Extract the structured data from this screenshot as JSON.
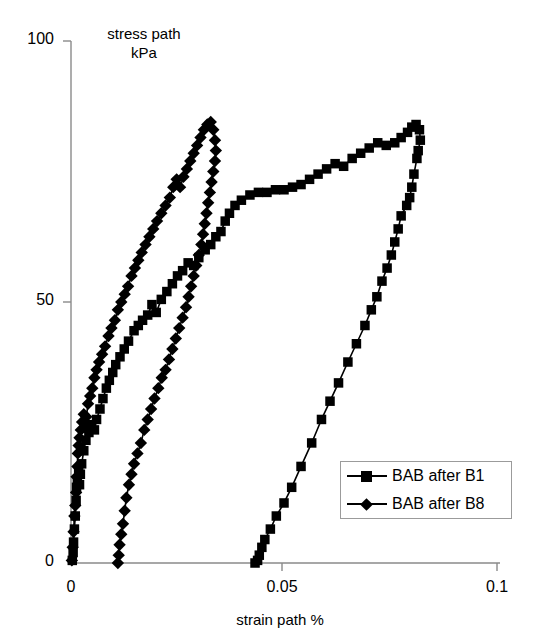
{
  "chart_data": {
    "type": "line",
    "title": "",
    "xlabel": "strain path %",
    "ylabel": "stress path\nkPa",
    "ylabel_line1": "stress path",
    "ylabel_line2": "kPa",
    "xlim": [
      0,
      0.1
    ],
    "ylim": [
      0,
      100
    ],
    "xticks": [
      "0",
      "0.05",
      "0.1"
    ],
    "xtick_values": [
      0,
      0.05,
      0.1
    ],
    "yticks": [
      "0",
      "50",
      "100"
    ],
    "ytick_values": [
      0,
      50,
      100
    ],
    "grid": false,
    "legend_position": "lower-right",
    "series": [
      {
        "name": "BAB after B1",
        "marker": "square",
        "color": "#000000",
        "points": [
          [
            0.0003,
            0.5
          ],
          [
            0.0005,
            2.0
          ],
          [
            0.0006,
            4.0
          ],
          [
            0.0008,
            6.5
          ],
          [
            0.001,
            9.0
          ],
          [
            0.0012,
            12.0
          ],
          [
            0.0013,
            14.5
          ],
          [
            0.0015,
            16.0
          ],
          [
            0.0018,
            17.5
          ],
          [
            0.002,
            15.0
          ],
          [
            0.0022,
            17.0
          ],
          [
            0.0025,
            19.0
          ],
          [
            0.003,
            21.5
          ],
          [
            0.0035,
            23.5
          ],
          [
            0.0042,
            25.0
          ],
          [
            0.0048,
            26.5
          ],
          [
            0.0055,
            25.5
          ],
          [
            0.006,
            27.5
          ],
          [
            0.0068,
            29.5
          ],
          [
            0.0075,
            31.5
          ],
          [
            0.0083,
            33.5
          ],
          [
            0.009,
            35.0
          ],
          [
            0.0098,
            36.5
          ],
          [
            0.0105,
            38.0
          ],
          [
            0.0115,
            39.5
          ],
          [
            0.0125,
            41.0
          ],
          [
            0.0135,
            42.5
          ],
          [
            0.0148,
            44.5
          ],
          [
            0.0158,
            45.5
          ],
          [
            0.0168,
            46.5
          ],
          [
            0.018,
            47.5
          ],
          [
            0.019,
            49.5
          ],
          [
            0.02,
            48.0
          ],
          [
            0.0212,
            50.5
          ],
          [
            0.0225,
            52.0
          ],
          [
            0.0238,
            53.5
          ],
          [
            0.025,
            55.0
          ],
          [
            0.0262,
            56.0
          ],
          [
            0.0275,
            57.5
          ],
          [
            0.0288,
            57.0
          ],
          [
            0.03,
            58.5
          ],
          [
            0.0315,
            60.0
          ],
          [
            0.0328,
            61.0
          ],
          [
            0.034,
            62.5
          ],
          [
            0.0352,
            63.5
          ],
          [
            0.0362,
            65.5
          ],
          [
            0.0372,
            67.0
          ],
          [
            0.0385,
            68.5
          ],
          [
            0.04,
            69.5
          ],
          [
            0.042,
            70.5
          ],
          [
            0.044,
            71.0
          ],
          [
            0.046,
            71.0
          ],
          [
            0.048,
            71.5
          ],
          [
            0.05,
            71.5
          ],
          [
            0.052,
            72.0
          ],
          [
            0.054,
            72.5
          ],
          [
            0.056,
            73.5
          ],
          [
            0.058,
            74.5
          ],
          [
            0.06,
            75.5
          ],
          [
            0.062,
            76.5
          ],
          [
            0.064,
            76.0
          ],
          [
            0.066,
            77.5
          ],
          [
            0.068,
            78.5
          ],
          [
            0.07,
            79.5
          ],
          [
            0.072,
            80.5
          ],
          [
            0.074,
            80.0
          ],
          [
            0.076,
            80.5
          ],
          [
            0.0775,
            81.5
          ],
          [
            0.079,
            82.5
          ],
          [
            0.08,
            83.5
          ],
          [
            0.081,
            84.0
          ],
          [
            0.0818,
            83.0
          ],
          [
            0.082,
            81.0
          ],
          [
            0.0815,
            79.0
          ],
          [
            0.0812,
            77.5
          ],
          [
            0.0805,
            74.5
          ],
          [
            0.08,
            72.0
          ],
          [
            0.0795,
            70.0
          ],
          [
            0.0788,
            68.5
          ],
          [
            0.0775,
            66.5
          ],
          [
            0.0768,
            64.0
          ],
          [
            0.076,
            61.5
          ],
          [
            0.0752,
            59.0
          ],
          [
            0.0742,
            56.5
          ],
          [
            0.073,
            54.0
          ],
          [
            0.0718,
            51.0
          ],
          [
            0.0705,
            48.5
          ],
          [
            0.069,
            45.5
          ],
          [
            0.067,
            42.0
          ],
          [
            0.065,
            38.5
          ],
          [
            0.0628,
            34.5
          ],
          [
            0.0608,
            31.0
          ],
          [
            0.0588,
            27.5
          ],
          [
            0.0565,
            23.0
          ],
          [
            0.054,
            18.5
          ],
          [
            0.0518,
            14.5
          ],
          [
            0.05,
            11.5
          ],
          [
            0.0482,
            9.0
          ],
          [
            0.0468,
            6.5
          ],
          [
            0.0455,
            4.5
          ],
          [
            0.0448,
            3.0
          ],
          [
            0.0442,
            1.5
          ],
          [
            0.0438,
            0.5
          ],
          [
            0.0432,
            0.0
          ]
        ]
      },
      {
        "name": "BAB after B8",
        "marker": "diamond",
        "color": "#000000",
        "points": [
          [
            0.0002,
            0.5
          ],
          [
            0.0004,
            3.0
          ],
          [
            0.0006,
            6.0
          ],
          [
            0.0008,
            9.0
          ],
          [
            0.001,
            11.0
          ],
          [
            0.0012,
            13.5
          ],
          [
            0.0013,
            16.5
          ],
          [
            0.0015,
            18.5
          ],
          [
            0.0016,
            21.0
          ],
          [
            0.0018,
            22.5
          ],
          [
            0.002,
            24.0
          ],
          [
            0.0023,
            25.5
          ],
          [
            0.0026,
            27.0
          ],
          [
            0.003,
            28.5
          ],
          [
            0.0033,
            26.0
          ],
          [
            0.0036,
            28.0
          ],
          [
            0.004,
            30.5
          ],
          [
            0.0045,
            32.0
          ],
          [
            0.005,
            33.5
          ],
          [
            0.0055,
            35.5
          ],
          [
            0.006,
            37.0
          ],
          [
            0.0066,
            38.5
          ],
          [
            0.0073,
            40.0
          ],
          [
            0.008,
            41.5
          ],
          [
            0.0088,
            43.5
          ],
          [
            0.0095,
            45.0
          ],
          [
            0.0103,
            46.5
          ],
          [
            0.011,
            48.5
          ],
          [
            0.0118,
            50.0
          ],
          [
            0.0126,
            51.5
          ],
          [
            0.0134,
            53.0
          ],
          [
            0.0142,
            55.0
          ],
          [
            0.015,
            56.5
          ],
          [
            0.0158,
            58.0
          ],
          [
            0.0166,
            59.5
          ],
          [
            0.0175,
            61.0
          ],
          [
            0.0184,
            62.5
          ],
          [
            0.0193,
            64.0
          ],
          [
            0.0202,
            65.5
          ],
          [
            0.0212,
            67.0
          ],
          [
            0.0222,
            68.5
          ],
          [
            0.0232,
            70.0
          ],
          [
            0.024,
            72.0
          ],
          [
            0.0248,
            73.5
          ],
          [
            0.0256,
            72.0
          ],
          [
            0.0264,
            74.0
          ],
          [
            0.0272,
            75.5
          ],
          [
            0.028,
            77.0
          ],
          [
            0.0288,
            78.5
          ],
          [
            0.0296,
            80.0
          ],
          [
            0.0304,
            81.5
          ],
          [
            0.0312,
            83.0
          ],
          [
            0.032,
            84.0
          ],
          [
            0.0328,
            84.5
          ],
          [
            0.0334,
            83.0
          ],
          [
            0.0338,
            81.0
          ],
          [
            0.034,
            79.0
          ],
          [
            0.0338,
            77.0
          ],
          [
            0.0334,
            75.0
          ],
          [
            0.033,
            73.0
          ],
          [
            0.0326,
            71.0
          ],
          [
            0.0322,
            69.0
          ],
          [
            0.0318,
            67.0
          ],
          [
            0.0314,
            65.0
          ],
          [
            0.031,
            63.0
          ],
          [
            0.0306,
            61.0
          ],
          [
            0.03,
            59.0
          ],
          [
            0.0294,
            57.0
          ],
          [
            0.0288,
            55.0
          ],
          [
            0.0282,
            53.0
          ],
          [
            0.0276,
            51.0
          ],
          [
            0.027,
            49.0
          ],
          [
            0.0262,
            47.0
          ],
          [
            0.0254,
            45.0
          ],
          [
            0.0246,
            43.0
          ],
          [
            0.0238,
            41.0
          ],
          [
            0.023,
            39.0
          ],
          [
            0.0222,
            37.0
          ],
          [
            0.0213,
            35.5
          ],
          [
            0.0205,
            33.5
          ],
          [
            0.0196,
            31.5
          ],
          [
            0.0188,
            29.5
          ],
          [
            0.018,
            27.5
          ],
          [
            0.0172,
            25.5
          ],
          [
            0.0164,
            23.0
          ],
          [
            0.0156,
            21.0
          ],
          [
            0.0148,
            19.0
          ],
          [
            0.0142,
            17.0
          ],
          [
            0.0136,
            15.0
          ],
          [
            0.013,
            12.5
          ],
          [
            0.0126,
            10.0
          ],
          [
            0.0122,
            7.5
          ],
          [
            0.0118,
            5.5
          ],
          [
            0.0114,
            3.5
          ],
          [
            0.0112,
            1.5
          ],
          [
            0.011,
            0.0
          ]
        ]
      }
    ]
  },
  "legend": {
    "items": [
      {
        "label": "BAB after B1",
        "marker": "square"
      },
      {
        "label": "BAB after B8",
        "marker": "diamond"
      }
    ]
  },
  "axes": {
    "y_title_line1": "stress path",
    "y_title_line2": "kPa",
    "x_title": "strain path %",
    "y_tick_100": "100",
    "y_tick_50": "50",
    "y_tick_0": "0",
    "x_tick_0": "0",
    "x_tick_005": "0.05",
    "x_tick_01": "0.1"
  }
}
